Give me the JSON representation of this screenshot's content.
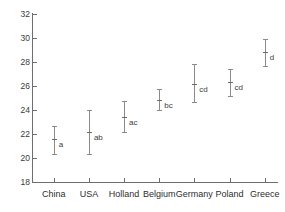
{
  "chart_data": {
    "type": "scatter",
    "title": "",
    "xlabel": "",
    "ylabel": "",
    "ylim": [
      18,
      32
    ],
    "ytick_step": 2,
    "yticks": [
      18,
      20,
      22,
      24,
      26,
      28,
      30,
      32
    ],
    "grid": false,
    "legend": "none",
    "error_bar_style": "mean with capped range bars",
    "annotation_note": "letters denote significance groupings",
    "categories": [
      "China",
      "USA",
      "Holland",
      "Belgium",
      "Germany",
      "Poland",
      "Greece"
    ],
    "values": [
      21.6,
      22.15,
      23.4,
      24.8,
      26.2,
      26.3,
      28.8
    ],
    "lower": [
      20.35,
      20.35,
      22.15,
      24.0,
      24.7,
      25.15,
      27.7
    ],
    "upper": [
      22.7,
      24.0,
      24.75,
      25.75,
      27.85,
      27.45,
      29.9
    ],
    "letters": [
      "a",
      "ab",
      "ac",
      "bc",
      "cd",
      "cd",
      "d"
    ],
    "points": [
      {
        "category": "China",
        "mean": 21.6,
        "lower": 20.35,
        "upper": 22.7,
        "letter": "a"
      },
      {
        "category": "USA",
        "mean": 22.15,
        "lower": 20.35,
        "upper": 24.0,
        "letter": "ab"
      },
      {
        "category": "Holland",
        "mean": 23.4,
        "lower": 22.15,
        "upper": 24.75,
        "letter": "ac"
      },
      {
        "category": "Belgium",
        "mean": 24.8,
        "lower": 24.0,
        "upper": 25.75,
        "letter": "bc"
      },
      {
        "category": "Germany",
        "mean": 26.2,
        "lower": 24.7,
        "upper": 27.85,
        "letter": "cd"
      },
      {
        "category": "Poland",
        "mean": 26.3,
        "lower": 25.15,
        "upper": 27.45,
        "letter": "cd"
      },
      {
        "category": "Greece",
        "mean": 28.8,
        "lower": 27.7,
        "upper": 29.9,
        "letter": "d"
      }
    ]
  },
  "colors": {
    "axis": "#6e6e6e",
    "bar": "#8a8a8a",
    "marker": "#6a6a6a",
    "text": "#2e2e2e",
    "background": "#ffffff"
  }
}
